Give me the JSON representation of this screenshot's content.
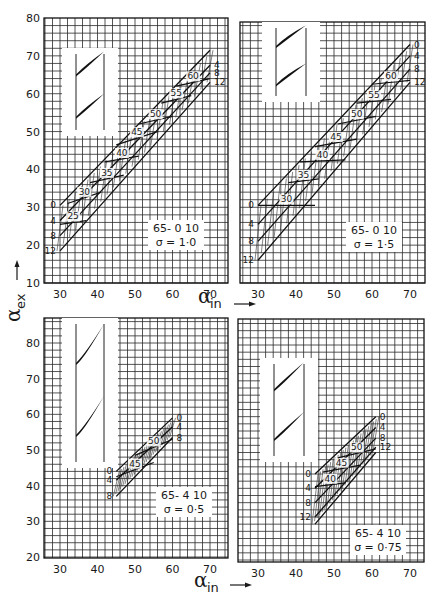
{
  "figure": {
    "y_axis_title": "α",
    "y_axis_title_sub": "ex",
    "x_axis_title": "α",
    "x_axis_title_sub": "in"
  },
  "chart_data": [
    {
      "type": "line",
      "subtype": "carpet",
      "panel": "top-left",
      "title": "65- 0 10",
      "solidity_label": "σ = 1·0",
      "airfoil": "65-010",
      "solidity": 1.0,
      "xlabel": "α_in",
      "ylabel": "α_ex",
      "xticks": [
        30,
        40,
        50,
        60,
        70
      ],
      "yticks": [
        10,
        20,
        30,
        40,
        50,
        60,
        70,
        80
      ],
      "xlim": [
        25.7,
        74.8
      ],
      "ylim": [
        10,
        80
      ],
      "grid": true,
      "incidence_lines": [
        {
          "name": "0",
          "points": [
            [
              30,
              30.5
            ],
            [
              70,
              71.5
            ]
          ]
        },
        {
          "name": "4",
          "points": [
            [
              30,
              26.5
            ],
            [
              70,
              67.5
            ]
          ]
        },
        {
          "name": "8",
          "points": [
            [
              30,
              22.5
            ],
            [
              70,
              65.5
            ]
          ]
        },
        {
          "name": "12",
          "points": [
            [
              30,
              18.5
            ],
            [
              70,
              63
            ]
          ]
        }
      ],
      "stagger_lines": [
        {
          "name": "25",
          "points": [
            [
              30,
              25.5
            ],
            [
              37,
              26.5
            ]
          ]
        },
        {
          "name": "30",
          "points": [
            [
              32,
              31
            ],
            [
              41,
              34
            ]
          ]
        },
        {
          "name": "35",
          "points": [
            [
              38,
              36.5
            ],
            [
              47,
              38.5
            ]
          ]
        },
        {
          "name": "40",
          "points": [
            [
              42,
              42
            ],
            [
              51,
              43.5
            ]
          ]
        },
        {
          "name": "45",
          "points": [
            [
              45,
              46.5
            ],
            [
              56,
              50
            ]
          ]
        },
        {
          "name": "50",
          "points": [
            [
              51,
              52
            ],
            [
              60,
              54
            ]
          ]
        },
        {
          "name": "55",
          "points": [
            [
              57,
              57.5
            ],
            [
              65,
              59.5
            ]
          ]
        },
        {
          "name": "60",
          "points": [
            [
              61,
              62
            ],
            [
              70,
              64
            ]
          ]
        }
      ],
      "stagger_labels": [
        "25",
        "30",
        "35",
        "40",
        "45",
        "50",
        "55",
        "60"
      ],
      "incidence_labels": [
        "0",
        "4",
        "8",
        "12"
      ]
    },
    {
      "type": "line",
      "subtype": "carpet",
      "panel": "top-right",
      "title": "65- 0 10",
      "solidity_label": "σ = 1·5",
      "airfoil": "65-010",
      "solidity": 1.5,
      "xlabel": "α_in",
      "ylabel": "α_ex",
      "xticks": [
        30,
        40,
        50,
        60,
        70
      ],
      "yticks": [
        10,
        20,
        30,
        40,
        50,
        60,
        70,
        80
      ],
      "xlim": [
        25.3,
        75
      ],
      "ylim": [
        10,
        79
      ],
      "grid": true,
      "incidence_lines": [
        {
          "name": "0",
          "points": [
            [
              30,
              30.5
            ],
            [
              70,
              73
            ]
          ]
        },
        {
          "name": "4",
          "points": [
            [
              30,
              25.5
            ],
            [
              70,
              70
            ]
          ]
        },
        {
          "name": "8",
          "points": [
            [
              30,
              21
            ],
            [
              70,
              66.5
            ]
          ]
        },
        {
          "name": "12",
          "points": [
            [
              30,
              16
            ],
            [
              70,
              63
            ]
          ]
        }
      ],
      "stagger_lines": [
        {
          "name": "30",
          "points": [
            [
              30,
              30.5
            ],
            [
              45,
              30.5
            ]
          ]
        },
        {
          "name": "35",
          "points": [
            [
              38,
              36.5
            ],
            [
              46,
              37.5
            ]
          ]
        },
        {
          "name": "40",
          "points": [
            [
              41,
              42
            ],
            [
              53,
              42.5
            ]
          ]
        },
        {
          "name": "45",
          "points": [
            [
              45,
              46
            ],
            [
              56,
              48
            ]
          ]
        },
        {
          "name": "50",
          "points": [
            [
              51,
              52
            ],
            [
              61,
              54
            ]
          ]
        },
        {
          "name": "55",
          "points": [
            [
              56,
              57.5
            ],
            [
              65,
              58.5
            ]
          ]
        },
        {
          "name": "60",
          "points": [
            [
              60,
              62.5
            ],
            [
              70,
              63.5
            ]
          ]
        }
      ],
      "stagger_labels": [
        "30",
        "35",
        "40",
        "45",
        "50",
        "55",
        "60"
      ],
      "incidence_labels": [
        "0",
        "4",
        "8",
        "12"
      ]
    },
    {
      "type": "line",
      "subtype": "carpet",
      "panel": "bottom-left",
      "title": "65- 4 10",
      "solidity_label": "σ = 0·5",
      "airfoil": "65-410",
      "solidity": 0.5,
      "xlabel": "α_in",
      "ylabel": "α_ex",
      "xticks": [
        30,
        40,
        50,
        60,
        70
      ],
      "yticks": [
        20,
        30,
        40,
        50,
        60,
        70,
        80
      ],
      "xlim": [
        25.7,
        74.8
      ],
      "ylim": [
        20,
        87
      ],
      "grid": true,
      "incidence_lines": [
        {
          "name": "0",
          "points": [
            [
              45,
              44
            ],
            [
              60,
              59
            ]
          ]
        },
        {
          "name": "4",
          "points": [
            [
              45,
              41.5
            ],
            [
              60,
              56.5
            ]
          ]
        },
        {
          "name": "8",
          "points": [
            [
              45,
              37
            ],
            [
              60,
              53.5
            ]
          ]
        }
      ],
      "stagger_lines": [
        {
          "name": "45",
          "points": [
            [
              45,
              42.5
            ],
            [
              55,
              46.5
            ]
          ]
        },
        {
          "name": "50",
          "points": [
            [
              50,
              48.5
            ],
            [
              60,
              53
            ]
          ]
        }
      ],
      "stagger_labels": [
        "45",
        "50"
      ],
      "incidence_labels": [
        "0",
        "4",
        "8"
      ]
    },
    {
      "type": "line",
      "subtype": "carpet",
      "panel": "bottom-right",
      "title": "65- 4 10",
      "solidity_label": "σ = 0·75",
      "airfoil": "65-410",
      "solidity": 0.75,
      "xlabel": "α_in",
      "ylabel": "α_ex",
      "xticks": [
        30,
        40,
        50,
        60,
        70
      ],
      "yticks": [
        20,
        30,
        40,
        50,
        60,
        70,
        80
      ],
      "xlim": [
        25.5,
        74.6
      ],
      "ylim": [
        20,
        87
      ],
      "grid": true,
      "incidence_lines": [
        {
          "name": "0",
          "points": [
            [
              45,
              44
            ],
            [
              61,
              60
            ]
          ]
        },
        {
          "name": "4",
          "points": [
            [
              45,
              40
            ],
            [
              61,
              57
            ]
          ]
        },
        {
          "name": "8",
          "points": [
            [
              45,
              36
            ],
            [
              61,
              54
            ]
          ]
        },
        {
          "name": "12",
          "points": [
            [
              45,
              32
            ],
            [
              61,
              51.5
            ]
          ]
        },
        {
          "name": "",
          "points": [
            [
              45,
              30
            ],
            [
              61,
              50
            ]
          ]
        }
      ],
      "stagger_lines": [
        {
          "name": "40",
          "points": [
            [
              45,
              40.5
            ],
            [
              53,
              41.5
            ]
          ]
        },
        {
          "name": "45",
          "points": [
            [
              47,
              44.5
            ],
            [
              57,
              46.5
            ]
          ]
        },
        {
          "name": "50",
          "points": [
            [
              51,
              48.5
            ],
            [
              61,
              51
            ]
          ]
        }
      ],
      "stagger_labels": [
        "40",
        "45",
        "50"
      ],
      "incidence_labels": [
        "0",
        "4",
        "8",
        "12"
      ]
    }
  ],
  "panels_layout": [
    {
      "x0": 44,
      "x1": 228,
      "y0": 18,
      "y1": 283,
      "xref": [
        30,
        60,
        70,
        210
      ],
      "yref": [
        80,
        18,
        10,
        283
      ],
      "show_yticks": true,
      "inset": {
        "x": 62,
        "y": 48,
        "w": 56,
        "h": 88
      },
      "annot": {
        "x": 148,
        "y": 220,
        "w": 56,
        "h": 30
      }
    },
    {
      "x0": 240,
      "x1": 425,
      "y0": 22,
      "y1": 283,
      "xref": [
        30,
        258,
        70,
        410
      ],
      "yref": [
        80,
        18,
        10,
        283
      ],
      "show_yticks": false,
      "inset": {
        "x": 262,
        "y": 22,
        "w": 58,
        "h": 80
      },
      "annot": {
        "x": 346,
        "y": 222,
        "w": 56,
        "h": 30
      }
    },
    {
      "x0": 44,
      "x1": 228,
      "y0": 318,
      "y1": 558,
      "xref": [
        30,
        60,
        70,
        210
      ],
      "yref": [
        80,
        343,
        20,
        557
      ],
      "show_yticks": true,
      "inset": {
        "x": 62,
        "y": 318,
        "w": 56,
        "h": 150
      },
      "annot": {
        "x": 156,
        "y": 487,
        "w": 56,
        "h": 30
      }
    },
    {
      "x0": 238,
      "x1": 424,
      "y0": 319,
      "y1": 562,
      "xref": [
        30,
        258,
        70,
        410
      ],
      "yref": [
        80,
        345,
        20,
        560
      ],
      "show_yticks": false,
      "inset": {
        "x": 260,
        "y": 358,
        "w": 58,
        "h": 104
      },
      "annot": {
        "x": 350,
        "y": 525,
        "w": 56,
        "h": 30
      }
    }
  ]
}
